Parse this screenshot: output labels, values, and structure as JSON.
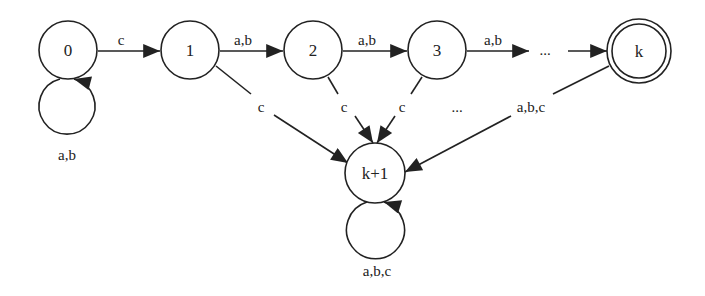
{
  "diagram": {
    "type": "finite-automaton",
    "states": [
      {
        "id": "s0",
        "label": "0",
        "accepting": false
      },
      {
        "id": "s1",
        "label": "1",
        "accepting": false
      },
      {
        "id": "s2",
        "label": "2",
        "accepting": false
      },
      {
        "id": "s3",
        "label": "3",
        "accepting": false
      },
      {
        "id": "sk",
        "label": "k",
        "accepting": true
      },
      {
        "id": "skp1",
        "label": "k+1",
        "accepting": false
      }
    ],
    "transitions": [
      {
        "from": "0",
        "to": "0",
        "label": "a,b"
      },
      {
        "from": "0",
        "to": "1",
        "label": "c"
      },
      {
        "from": "1",
        "to": "2",
        "label": "a,b"
      },
      {
        "from": "2",
        "to": "3",
        "label": "a,b"
      },
      {
        "from": "3",
        "to": "...",
        "label": "a,b"
      },
      {
        "from": "...",
        "to": "k",
        "label": ""
      },
      {
        "from": "1",
        "to": "k+1",
        "label": "c"
      },
      {
        "from": "2",
        "to": "k+1",
        "label": "c"
      },
      {
        "from": "3",
        "to": "k+1",
        "label": "c"
      },
      {
        "from": "...",
        "to": "k+1",
        "label": "..."
      },
      {
        "from": "k",
        "to": "k+1",
        "label": "a,b,c"
      },
      {
        "from": "k+1",
        "to": "k+1",
        "label": "a,b,c"
      }
    ],
    "ellipsis_top": "...",
    "ellipsis_mid": "..."
  }
}
